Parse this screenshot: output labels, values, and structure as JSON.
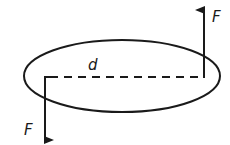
{
  "diagram": {
    "labels": {
      "force_top": "F",
      "force_bottom": "F",
      "distance": "d"
    },
    "colors": {
      "stroke": "#1a1a1a",
      "background": "#ffffff"
    }
  }
}
